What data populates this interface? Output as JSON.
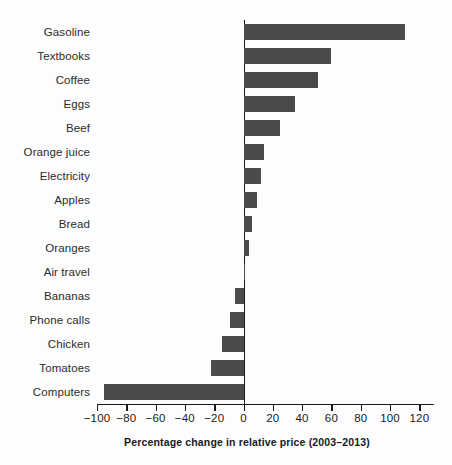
{
  "chart_data": {
    "type": "bar",
    "orientation": "horizontal",
    "title": "",
    "subtitle": "",
    "xlabel": "Percentage change in relative price (2003–2013)",
    "ylabel": "",
    "xlim": [
      -100,
      130
    ],
    "xticks": [
      -100,
      -80,
      -60,
      -40,
      -20,
      0,
      20,
      40,
      60,
      80,
      100,
      120
    ],
    "xtick_labels": [
      "−100",
      "−80",
      "−60",
      "−40",
      "−20",
      "0",
      "20",
      "40",
      "60",
      "80",
      "100",
      "120"
    ],
    "grid": false,
    "legend": null,
    "bar_color": "#4a4a4a",
    "axis_color": "#1a1a1a",
    "categories": [
      "Gasoline",
      "Textbooks",
      "Coffee",
      "Eggs",
      "Beef",
      "Orange juice",
      "Electricity",
      "Apples",
      "Bread",
      "Oranges",
      "Air travel",
      "Bananas",
      "Phone calls",
      "Chicken",
      "Tomatoes",
      "Computers"
    ],
    "values": [
      110,
      60,
      51,
      35,
      25,
      14,
      12,
      9,
      6,
      4,
      1,
      -6,
      -9,
      -15,
      -22,
      -95
    ]
  }
}
